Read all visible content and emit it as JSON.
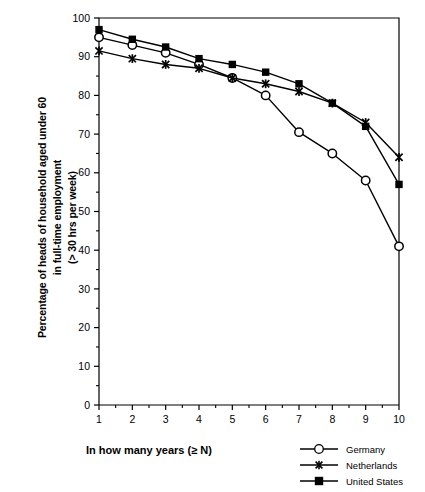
{
  "chart_data": {
    "type": "line",
    "title": "",
    "xlabel": "In how many years (≥ N)",
    "ylabel": "Percentage of heads of household aged under 60\nin full-time employment\n(> 30 hrs per week)",
    "x": [
      1,
      2,
      3,
      4,
      5,
      6,
      7,
      8,
      9,
      10
    ],
    "xtick_labels": [
      "1",
      "2",
      "3",
      "4",
      "5",
      "6",
      "7",
      "8",
      "9",
      "10"
    ],
    "ytick_labels": [
      "0",
      "10",
      "20",
      "30",
      "40",
      "50",
      "60",
      "70",
      "80",
      "90",
      "100"
    ],
    "xlim": [
      1,
      10
    ],
    "ylim": [
      0,
      100
    ],
    "ytick_step": 10,
    "grid": false,
    "legend_position": "bottom-right",
    "series": [
      {
        "name": "Germany",
        "marker": "open-circle",
        "color": "#000000",
        "values": [
          95,
          93,
          91,
          88,
          84.5,
          80,
          70.5,
          65,
          58,
          41
        ]
      },
      {
        "name": "Netherlands",
        "marker": "x-cross",
        "color": "#000000",
        "values": [
          91.5,
          89.5,
          88,
          87,
          84.5,
          83,
          81,
          78,
          73,
          64
        ]
      },
      {
        "name": "United States",
        "marker": "filled-square",
        "color": "#000000",
        "values": [
          97,
          94.5,
          92.5,
          89.5,
          88,
          86,
          83,
          78,
          72,
          57
        ]
      }
    ]
  },
  "axes": {
    "x_title": "In how many years (≥ N)",
    "y_title_line1": "Percentage of heads of household aged under 60",
    "y_title_line2": "in full-time employment",
    "y_title_line3": "(> 30 hrs per week)"
  },
  "legend": {
    "items": [
      {
        "label": "Germany",
        "marker": "open-circle"
      },
      {
        "label": "Netherlands",
        "marker": "x-cross"
      },
      {
        "label": "United States",
        "marker": "filled-square"
      }
    ]
  }
}
